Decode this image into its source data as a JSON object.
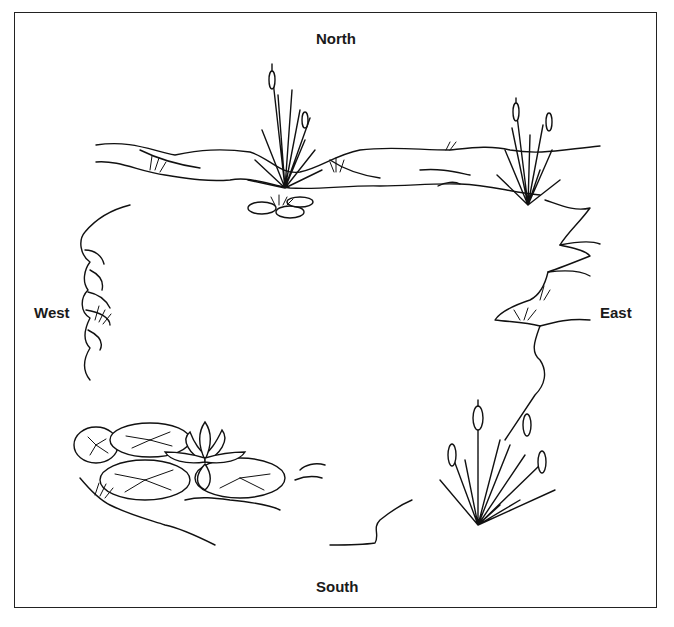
{
  "diagram": {
    "type": "pond-compass-illustration",
    "labels": {
      "north": "North",
      "south": "South",
      "west": "West",
      "east": "East"
    },
    "elements": [
      "cattail-cluster-north",
      "cattail-cluster-northeast",
      "cattail-cluster-southeast",
      "water-lily-with-pads-southwest",
      "small-lily-pads-north",
      "rocky-shoreline"
    ],
    "colors": {
      "ink": "#111111",
      "background": "#ffffff",
      "frame": "#222222"
    }
  }
}
